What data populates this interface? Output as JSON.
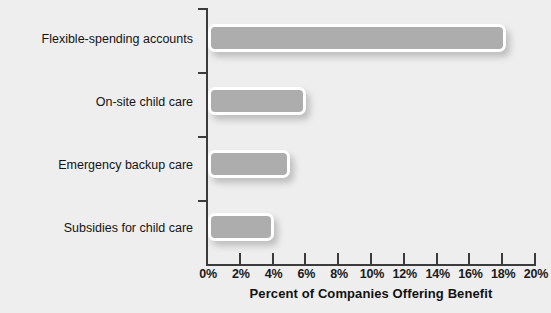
{
  "chart_data": {
    "type": "bar",
    "orientation": "horizontal",
    "title": "",
    "xlabel": "Percent of Companies Offering Benefit",
    "ylabel": "",
    "categories": [
      "Flexible-spending accounts",
      "On-site child care",
      "Emergency backup care",
      "Subsidies for child care"
    ],
    "values": [
      18.2,
      6,
      5,
      4
    ],
    "xlim": [
      0,
      20
    ],
    "xticks": [
      0,
      2,
      4,
      6,
      8,
      10,
      12,
      14,
      16,
      18,
      20
    ],
    "xtick_labels": [
      "0%",
      "2%",
      "4%",
      "6%",
      "8%",
      "10%",
      "12%",
      "14%",
      "16%",
      "18%",
      "20%"
    ],
    "grid": false,
    "legend": null,
    "colors": {
      "background": "#eeeeee",
      "bar_fill": "#adadad",
      "bar_border": "#ffffff",
      "axis": "#3b3b3b",
      "text": "#141414"
    }
  }
}
